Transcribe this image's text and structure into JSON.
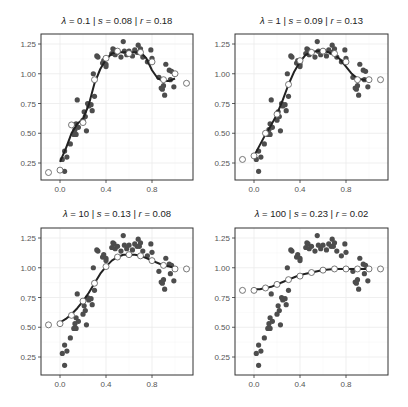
{
  "chart_data": [
    {
      "type": "scatter",
      "title": "λ = 0.1 | s = 0.08 | r = 0.18",
      "lambda": "0.1",
      "s": "0.08",
      "r": "0.18",
      "xlabel": "",
      "ylabel": "",
      "xlim": [
        -0.12,
        1.12
      ],
      "ylim": [
        0.12,
        1.32
      ],
      "xticks": [
        0.0,
        0.4,
        0.8
      ],
      "yticks": [
        0.25,
        0.5,
        0.75,
        1.0,
        1.25
      ],
      "grid": true,
      "fit_curve": {
        "x": [
          0.0,
          0.05,
          0.1,
          0.15,
          0.2,
          0.25,
          0.3,
          0.35,
          0.4,
          0.45,
          0.5,
          0.55,
          0.6,
          0.65,
          0.7,
          0.75,
          0.8,
          0.85,
          0.9,
          0.95,
          1.0
        ],
        "y": [
          0.26,
          0.37,
          0.5,
          0.58,
          0.62,
          0.74,
          0.92,
          1.04,
          1.12,
          1.17,
          1.18,
          1.18,
          1.18,
          1.18,
          1.18,
          1.13,
          1.03,
          0.96,
          0.94,
          0.94,
          0.96
        ]
      },
      "open_points": {
        "x": [
          -0.1,
          0.0,
          0.1,
          0.2,
          0.3,
          0.4,
          0.5,
          0.6,
          0.7,
          0.8,
          0.9,
          1.0,
          1.1
        ],
        "y": [
          0.17,
          0.19,
          0.57,
          0.59,
          0.95,
          1.13,
          1.19,
          1.17,
          1.18,
          1.1,
          0.95,
          1.0,
          0.92
        ]
      }
    },
    {
      "type": "scatter",
      "title": "λ = 1 | s = 0.09 | r = 0.13",
      "lambda": "1",
      "s": "0.09",
      "r": "0.13",
      "xlim": [
        -0.12,
        1.12
      ],
      "ylim": [
        0.12,
        1.32
      ],
      "xticks": [
        0.0,
        0.4,
        0.8
      ],
      "yticks": [
        0.25,
        0.5,
        0.75,
        1.0,
        1.25
      ],
      "grid": true,
      "fit_curve": {
        "x": [
          0.0,
          0.05,
          0.1,
          0.15,
          0.2,
          0.25,
          0.3,
          0.35,
          0.4,
          0.45,
          0.5,
          0.55,
          0.6,
          0.65,
          0.7,
          0.75,
          0.8,
          0.85,
          0.9,
          0.95,
          1.0
        ],
        "y": [
          0.31,
          0.4,
          0.49,
          0.57,
          0.66,
          0.78,
          0.91,
          1.02,
          1.1,
          1.16,
          1.18,
          1.19,
          1.19,
          1.18,
          1.16,
          1.12,
          1.06,
          1.0,
          0.96,
          0.95,
          0.95
        ]
      },
      "open_points": {
        "x": [
          -0.1,
          0.0,
          0.1,
          0.2,
          0.3,
          0.4,
          0.5,
          0.6,
          0.7,
          0.8,
          0.9,
          1.0,
          1.1
        ],
        "y": [
          0.28,
          0.31,
          0.5,
          0.66,
          0.91,
          1.11,
          1.18,
          1.19,
          1.17,
          1.1,
          0.95,
          0.95,
          0.95
        ]
      }
    },
    {
      "type": "scatter",
      "title": "λ = 10 | s = 0.13 | r = 0.08",
      "lambda": "10",
      "s": "0.13",
      "r": "0.08",
      "xlim": [
        -0.12,
        1.12
      ],
      "ylim": [
        0.12,
        1.32
      ],
      "xticks": [
        0.0,
        0.4,
        0.8
      ],
      "yticks": [
        0.25,
        0.5,
        0.75,
        1.0,
        1.25
      ],
      "grid": true,
      "fit_curve": {
        "x": [
          0.0,
          0.05,
          0.1,
          0.15,
          0.2,
          0.25,
          0.3,
          0.35,
          0.4,
          0.45,
          0.5,
          0.55,
          0.6,
          0.65,
          0.7,
          0.75,
          0.8,
          0.85,
          0.9,
          0.95,
          1.0
        ],
        "y": [
          0.54,
          0.57,
          0.61,
          0.66,
          0.72,
          0.79,
          0.87,
          0.95,
          1.01,
          1.06,
          1.09,
          1.11,
          1.11,
          1.11,
          1.1,
          1.08,
          1.06,
          1.04,
          1.02,
          1.01,
          1.0
        ]
      },
      "open_points": {
        "x": [
          -0.1,
          0.0,
          0.1,
          0.2,
          0.3,
          0.4,
          0.5,
          0.6,
          0.7,
          0.8,
          0.9,
          1.0,
          1.1
        ],
        "y": [
          0.52,
          0.53,
          0.6,
          0.72,
          0.87,
          1.01,
          1.09,
          1.11,
          1.1,
          1.06,
          1.02,
          0.99,
          0.99
        ]
      }
    },
    {
      "type": "scatter",
      "title": "λ = 100 | s = 0.23 | r = 0.02",
      "lambda": "100",
      "s": "0.23",
      "r": "0.02",
      "xlim": [
        -0.12,
        1.12
      ],
      "ylim": [
        0.12,
        1.32
      ],
      "xticks": [
        0.0,
        0.4,
        0.8
      ],
      "yticks": [
        0.25,
        0.5,
        0.75,
        1.0,
        1.25
      ],
      "grid": true,
      "fit_curve": {
        "x": [
          0.0,
          0.05,
          0.1,
          0.15,
          0.2,
          0.25,
          0.3,
          0.35,
          0.4,
          0.45,
          0.5,
          0.55,
          0.6,
          0.65,
          0.7,
          0.75,
          0.8,
          0.85,
          0.9,
          0.95,
          1.0
        ],
        "y": [
          0.82,
          0.82,
          0.83,
          0.84,
          0.86,
          0.88,
          0.9,
          0.92,
          0.94,
          0.95,
          0.96,
          0.97,
          0.98,
          0.985,
          0.99,
          0.99,
          0.99,
          0.99,
          0.99,
          0.99,
          0.99
        ]
      },
      "open_points": {
        "x": [
          -0.1,
          0.0,
          0.1,
          0.2,
          0.3,
          0.4,
          0.5,
          0.6,
          0.7,
          0.8,
          0.9,
          1.0,
          1.1
        ],
        "y": [
          0.81,
          0.81,
          0.83,
          0.86,
          0.9,
          0.93,
          0.96,
          0.98,
          0.99,
          0.99,
          0.99,
          0.99,
          0.99
        ]
      }
    }
  ],
  "observed_points": {
    "x": [
      0.02,
      0.04,
      0.04,
      0.06,
      0.09,
      0.12,
      0.13,
      0.14,
      0.14,
      0.15,
      0.16,
      0.2,
      0.21,
      0.22,
      0.23,
      0.24,
      0.25,
      0.27,
      0.28,
      0.29,
      0.3,
      0.32,
      0.33,
      0.37,
      0.38,
      0.4,
      0.4,
      0.45,
      0.46,
      0.47,
      0.48,
      0.5,
      0.53,
      0.55,
      0.56,
      0.58,
      0.6,
      0.63,
      0.65,
      0.67,
      0.68,
      0.69,
      0.7,
      0.72,
      0.76,
      0.79,
      0.8,
      0.86,
      0.88,
      0.89,
      0.9,
      0.91,
      0.92,
      0.95,
      0.96,
      0.97,
      0.99
    ],
    "y": [
      0.28,
      0.35,
      0.18,
      0.3,
      0.41,
      0.49,
      0.53,
      0.58,
      0.49,
      0.78,
      0.55,
      0.61,
      0.68,
      0.64,
      0.52,
      0.75,
      0.73,
      0.74,
      0.69,
      1.0,
      0.81,
      1.15,
      1.14,
      1.09,
      1.11,
      1.08,
      1.06,
      1.17,
      1.21,
      1.2,
      1.16,
      1.18,
      1.14,
      1.27,
      1.19,
      1.16,
      1.19,
      1.15,
      1.2,
      1.18,
      1.24,
      1.18,
      1.21,
      1.14,
      1.1,
      1.2,
      1.13,
      0.97,
      0.88,
      0.87,
      0.9,
      0.82,
      1.08,
      1.03,
      0.95,
      1.02,
      0.89
    ]
  },
  "colors": {
    "curve": "#222222",
    "filled_point": "#4d4d4d",
    "open_point_stroke": "#555555",
    "panel_border": "#333333",
    "grid": "#ebebeb"
  }
}
